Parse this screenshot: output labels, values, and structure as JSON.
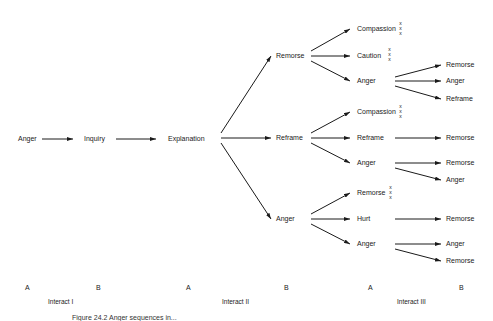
{
  "nodes": {
    "n_anger0": "Anger",
    "n_inquiry": "Inquiry",
    "n_explanation": "Explanation",
    "n_remorse1": "Remorse",
    "n_reframe1": "Reframe",
    "n_anger1": "Anger",
    "n_compassion_a": "Compassion",
    "n_caution_a": "Caution",
    "n_anger_a": "Anger",
    "n_compassion_b": "Compassion",
    "n_reframe_b": "Reframe",
    "n_anger_b": "Anger",
    "n_remorse_c": "Remorse",
    "n_hurt_c": "Hurt",
    "n_anger_c": "Anger",
    "n_remorse_a1": "Remorse",
    "n_anger_a1": "Anger",
    "n_reframe_a1": "Reframe",
    "n_remorse_b1": "Remorse",
    "n_remorse_b2": "Remorse",
    "n_anger_b2": "Anger",
    "n_remorse_c1": "Remorse",
    "n_anger_c2": "Anger",
    "n_remorse_c2": "Remorse"
  },
  "terminal_mark": "x",
  "columns": [
    "A",
    "B",
    "A",
    "B",
    "A",
    "B"
  ],
  "interacts": [
    "Interact I",
    "Interact II",
    "Interact III"
  ],
  "caption": "Figure 24.2  Anger sequences in..."
}
